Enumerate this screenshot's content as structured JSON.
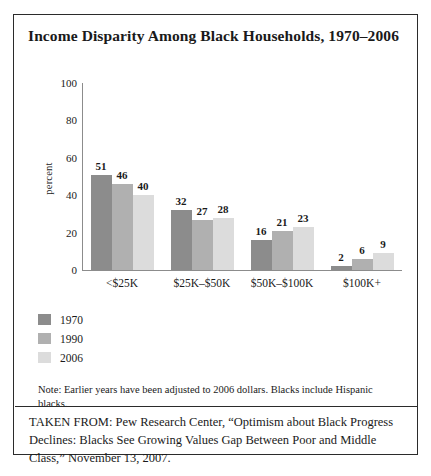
{
  "figure": {
    "title": "Income Disparity Among Black Households, 1970–2006",
    "note": "Note: Earlier years have been adjusted to 2006 dollars. Blacks include Hispanic blacks.",
    "source": "TAKEN FROM: Pew Research Center, “Optimism about Black Progress Declines: Blacks See Growing Values Gap Between Poor and Middle Class,” November 13, 2007."
  },
  "colors": {
    "series_1970": "#8c8c8c",
    "series_1990": "#b0b0b0",
    "series_2006": "#dcdcdc",
    "axis": "#8c8c8c",
    "border": "#2b2b2b",
    "text": "#1a1a1a"
  },
  "chart_data": {
    "type": "bar",
    "title": "Income Disparity Among Black Households, 1970–2006",
    "xlabel": "",
    "ylabel": "percent",
    "ylim": [
      0,
      100
    ],
    "yticks": [
      0,
      20,
      40,
      60,
      80,
      100
    ],
    "grid": false,
    "legend_position": "below-left",
    "categories": [
      "<$25K",
      "$25K–$50K",
      "$50K–$100K",
      "$100K+"
    ],
    "series": [
      {
        "name": "1970",
        "color": "#8c8c8c",
        "values": [
          51,
          32,
          16,
          2
        ]
      },
      {
        "name": "1990",
        "color": "#b0b0b0",
        "values": [
          46,
          27,
          21,
          6
        ]
      },
      {
        "name": "2006",
        "color": "#dcdcdc",
        "values": [
          40,
          28,
          23,
          9
        ]
      }
    ]
  }
}
